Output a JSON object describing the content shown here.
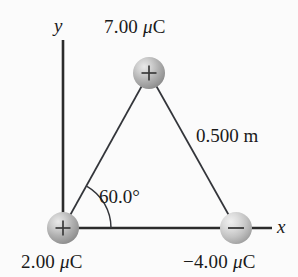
{
  "figure": {
    "background_color": "#fbfbfb",
    "line_color": "#2b2b2b",
    "text_color": "#1a1a1a",
    "axes": {
      "x_label": "x",
      "y_label": "y",
      "origin_label": ""
    },
    "labels": {
      "charge_top": "7.00 μC",
      "charge_top_value": "7.00",
      "charge_top_unit": "μC",
      "charge_top_sign": "+",
      "charge_bottom_left": "2.00 μC",
      "charge_bottom_left_value": "2.00",
      "charge_bottom_left_unit": "μC",
      "charge_bottom_left_sign": "+",
      "charge_bottom_right": "−4.00 μC",
      "charge_bottom_right_value": "−4.00",
      "charge_bottom_right_unit": "μC",
      "charge_bottom_right_sign": "−",
      "side_length": "0.500 m",
      "angle": "60.0°"
    },
    "spheres": [
      {
        "name": "charge-top",
        "sign": "+",
        "cx": 149,
        "cy": 73,
        "r": 16
      },
      {
        "name": "charge-bottom-left",
        "sign": "+",
        "cx": 63,
        "cy": 228,
        "r": 16
      },
      {
        "name": "charge-bottom-right",
        "sign": "−",
        "cx": 236,
        "cy": 228,
        "r": 16
      }
    ],
    "geometry": {
      "y_axis_top": 40,
      "y_axis_bottom": 228,
      "x_axis_left": 63,
      "x_axis_right": 272,
      "angle_arc_radius": 48
    }
  }
}
